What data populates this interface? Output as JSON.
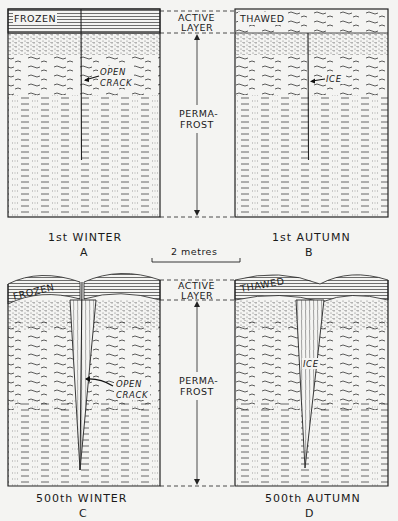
{
  "figure": {
    "scale_bar_label": "2 metres",
    "middle_labels": {
      "active_layer_line1": "ACTIVE",
      "active_layer_line2": "LAYER",
      "permafrost_line1": "PERMA-",
      "permafrost_line2": "FROST"
    },
    "panels": [
      {
        "id": "A",
        "caption": "1st WINTER",
        "letter": "A",
        "surface_label": "FROZEN",
        "annotation_line1": "OPEN",
        "annotation_line2": "CRACK"
      },
      {
        "id": "B",
        "caption": "1st AUTUMN",
        "letter": "B",
        "surface_label": "THAWED",
        "annotation_line1": "ICE",
        "annotation_line2": ""
      },
      {
        "id": "C",
        "caption": "500th WINTER",
        "letter": "C",
        "surface_label": "FROZEN",
        "annotation_line1": "OPEN",
        "annotation_line2": "CRACK"
      },
      {
        "id": "D",
        "caption": "500th AUTUMN",
        "letter": "D",
        "surface_label": "THAWED",
        "annotation_line1": "ICE",
        "annotation_line2": ""
      }
    ]
  }
}
